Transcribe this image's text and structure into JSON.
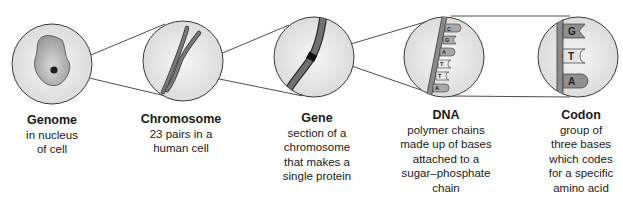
{
  "diagram": {
    "colors": {
      "outline": "#3a3a3a",
      "circle_fill": "#ebebeb",
      "nucleus_fill": "#b5b5b5",
      "chromosome_fill": "#6e6e6e",
      "base_fill": "#a9a9a9",
      "backbone_fill": "#8a8a8a"
    },
    "stages": [
      {
        "id": "genome",
        "title": "Genome",
        "description": "in nucleus\nof cell"
      },
      {
        "id": "chromosome",
        "title": "Chromosome",
        "description": "23 pairs in a\nhuman cell"
      },
      {
        "id": "gene",
        "title": "Gene",
        "description": "section of a\nchromosome\nthat makes a\nsingle protein"
      },
      {
        "id": "dna",
        "title": "DNA",
        "description": "polymer chains\nmade up of bases\nattached to a\nsugar–phosphate\nchain"
      },
      {
        "id": "codon",
        "title": "Codon",
        "description": "group of\nthree bases\nwhich codes\nfor a specific\namino acid"
      }
    ],
    "dna_bases": [
      "C",
      "G",
      "A",
      "T",
      "T",
      "A"
    ],
    "codon_bases": [
      "G",
      "T",
      "A"
    ]
  }
}
